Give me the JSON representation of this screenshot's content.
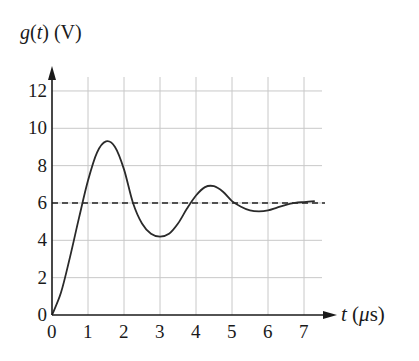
{
  "chart_data": {
    "type": "line",
    "title": "",
    "ylabel": "g(t) (V)",
    "xlabel": "t (μs)",
    "xlim": [
      0,
      7.5
    ],
    "ylim": [
      0,
      13
    ],
    "x_ticks": [
      0,
      1,
      2,
      3,
      4,
      5,
      6,
      7
    ],
    "y_ticks": [
      0,
      2,
      4,
      6,
      8,
      10,
      12
    ],
    "grid": true,
    "legend": null,
    "reference_line": {
      "style": "dashed",
      "y": 6,
      "label": "steady-state value"
    },
    "series": [
      {
        "name": "g(t)",
        "style": "solid",
        "x": [
          0,
          0.25,
          0.5,
          0.75,
          1.0,
          1.25,
          1.5,
          1.75,
          2.0,
          2.25,
          2.5,
          2.75,
          3.0,
          3.25,
          3.5,
          3.75,
          4.0,
          4.25,
          4.5,
          4.75,
          5.0,
          5.25,
          5.5,
          5.75,
          6.0,
          6.25,
          6.5,
          6.75,
          7.0,
          7.3
        ],
        "y": [
          0,
          1.2,
          3.1,
          5.2,
          7.2,
          8.7,
          9.3,
          9.0,
          7.8,
          6.0,
          4.9,
          4.35,
          4.2,
          4.35,
          4.9,
          5.7,
          6.4,
          6.85,
          6.9,
          6.6,
          6.1,
          5.8,
          5.6,
          5.55,
          5.6,
          5.75,
          5.9,
          6.0,
          6.05,
          6.1
        ]
      }
    ]
  },
  "axes": {
    "y_label": "g(t) (V)",
    "x_label": "t (μs)",
    "y_tick_labels": [
      "0",
      "2",
      "4",
      "6",
      "8",
      "10",
      "12"
    ],
    "x_tick_labels": [
      "0",
      "1",
      "2",
      "3",
      "4",
      "5",
      "6",
      "7"
    ]
  }
}
